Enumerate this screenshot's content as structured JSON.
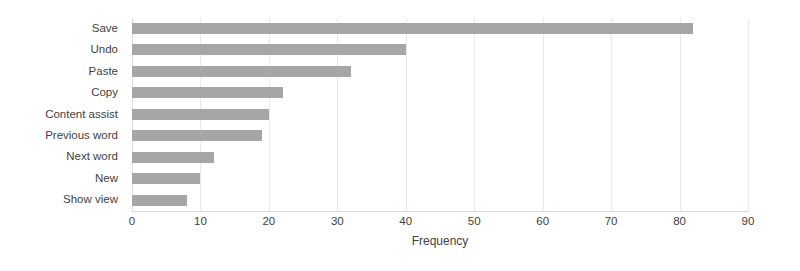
{
  "chart_data": {
    "type": "bar",
    "orientation": "horizontal",
    "title": "",
    "xlabel": "Frequency",
    "ylabel": "",
    "categories": [
      "Save",
      "Undo",
      "Paste",
      "Copy",
      "Content assist",
      "Previous word",
      "Next word",
      "New",
      "Show view"
    ],
    "values": [
      82,
      40,
      32,
      22,
      20,
      19,
      12,
      10,
      8
    ],
    "xlim": [
      0,
      90
    ],
    "xticks": [
      0,
      10,
      20,
      30,
      40,
      50,
      60,
      70,
      80,
      90
    ],
    "xtick_labels": [
      "0",
      "10",
      "20",
      "30",
      "40",
      "50",
      "60",
      "70",
      "80",
      "90"
    ],
    "grid": "vertical-light",
    "legend": "none",
    "bar_color": "#a6a6a6",
    "background_color": "#ffffff",
    "axis_color": "#dcdcdc"
  }
}
